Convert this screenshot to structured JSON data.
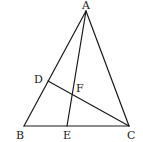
{
  "diagram": {
    "type": "triangle-geometry",
    "points": {
      "A": {
        "x": 86,
        "y": 11
      },
      "B": {
        "x": 24,
        "y": 126
      },
      "C": {
        "x": 129,
        "y": 126
      },
      "D": {
        "x": 48,
        "y": 81
      },
      "E": {
        "x": 67,
        "y": 126
      },
      "F": {
        "x": 72,
        "y": 95
      }
    },
    "labels": {
      "A": {
        "text": "A",
        "x": 82,
        "y": 9
      },
      "B": {
        "text": "B",
        "x": 16,
        "y": 139
      },
      "C": {
        "text": "C",
        "x": 127,
        "y": 139
      },
      "D": {
        "text": "D",
        "x": 34,
        "y": 83
      },
      "E": {
        "text": "E",
        "x": 63,
        "y": 139
      },
      "F": {
        "text": "F",
        "x": 76,
        "y": 92
      }
    },
    "segments": [
      {
        "from": "A",
        "to": "B"
      },
      {
        "from": "A",
        "to": "C"
      },
      {
        "from": "B",
        "to": "C"
      },
      {
        "from": "A",
        "to": "E"
      },
      {
        "from": "D",
        "to": "C"
      }
    ],
    "stroke_color": "#1a1a1a"
  }
}
